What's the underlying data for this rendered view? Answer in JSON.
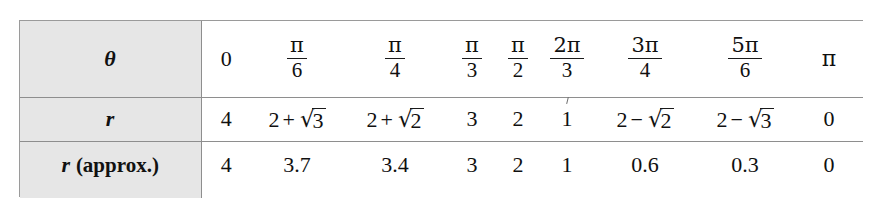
{
  "figure": {
    "kind": "math-table"
  },
  "table": {
    "row_labels": [
      {
        "symbol": "θ",
        "rest": ""
      },
      {
        "symbol": "r",
        "rest": ""
      },
      {
        "symbol": "r",
        "rest": " (approx.)"
      }
    ],
    "columns": [
      {
        "theta_display": "0",
        "theta_num": "",
        "theta_den": "",
        "r_exact": "4",
        "r_approx": "4"
      },
      {
        "theta_display": "",
        "theta_num": "π",
        "theta_den": "6",
        "r_exact": "2 + √3",
        "r_approx": "3.7"
      },
      {
        "theta_display": "",
        "theta_num": "π",
        "theta_den": "4",
        "r_exact": "2 + √2",
        "r_approx": "3.4"
      },
      {
        "theta_display": "",
        "theta_num": "π",
        "theta_den": "3",
        "r_exact": "3",
        "r_approx": "3"
      },
      {
        "theta_display": "",
        "theta_num": "π",
        "theta_den": "2",
        "r_exact": "2",
        "r_approx": "2"
      },
      {
        "theta_display": "",
        "theta_num": "2π",
        "theta_den": "3",
        "r_exact": "1",
        "r_approx": "1"
      },
      {
        "theta_display": "",
        "theta_num": "3π",
        "theta_den": "4",
        "r_exact": "2 − √2",
        "r_approx": "0.6"
      },
      {
        "theta_display": "",
        "theta_num": "5π",
        "theta_den": "6",
        "r_exact": "2 − √3",
        "r_approx": "0.3"
      },
      {
        "theta_display": "π",
        "theta_num": "",
        "theta_den": "",
        "r_exact": "0",
        "r_approx": "0"
      }
    ],
    "parts": {
      "pi": "π",
      "plus": "+",
      "minus": "−",
      "radical": "√",
      "two": "2",
      "three": "3",
      "approx_label": " (approx.)"
    },
    "colors": {
      "label_background": "#e6e6e6",
      "border": "#8e8e8e",
      "outer_border": "#9a9a9a",
      "text": "#101010",
      "page_background": "#ffffff"
    }
  }
}
